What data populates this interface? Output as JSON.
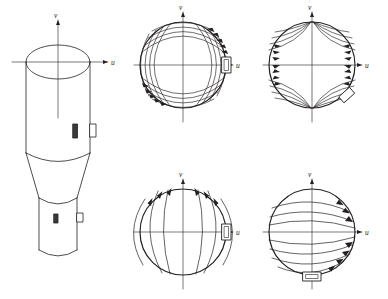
{
  "figure": {
    "kind": "technical-line-drawing",
    "background_color": "#ffffff",
    "line_color": "#231f20",
    "axis_labels": {
      "horizontal": "u",
      "vertical": "v"
    },
    "caption": ""
  },
  "body_3d": {
    "name": "stepped-cylindrical-body",
    "axis_label_v": "v",
    "axis_label_u": "u",
    "sections": [
      "upper-cylinder",
      "tapered-cone",
      "lower-cylinder"
    ],
    "markers": [
      {
        "name": "slot-marker-upper",
        "style": "filled"
      },
      {
        "name": "tab-marker-upper",
        "style": "outline"
      },
      {
        "name": "slot-marker-lower",
        "style": "filled"
      },
      {
        "name": "tab-marker-lower",
        "style": "outline"
      }
    ]
  },
  "panels": [
    {
      "id": "panel-top-left",
      "label_u": "u",
      "label_v": "v",
      "pattern": "quadrupole-saddle",
      "arrow_clusters": [
        "upper-right",
        "lower-left"
      ],
      "tab": {
        "position": "right",
        "orientation": "horizontal"
      },
      "curve_count": 4
    },
    {
      "id": "panel-top-right",
      "label_u": "u",
      "label_v": "v",
      "pattern": "hyperbolic-converging",
      "arrow_clusters": [
        "left-edge",
        "right-edge"
      ],
      "tab": {
        "position": "lower-right",
        "orientation": "angled"
      },
      "curve_count": 4
    },
    {
      "id": "panel-bottom-left",
      "label_u": "u",
      "label_v": "v",
      "pattern": "vertical-dipole",
      "arrow_clusters": [
        "upper-arc"
      ],
      "tab": {
        "position": "right",
        "orientation": "horizontal"
      },
      "curve_count": 5
    },
    {
      "id": "panel-bottom-right",
      "label_u": "u",
      "label_v": "v",
      "pattern": "horizontal-latitudinal",
      "arrow_clusters": [
        "upper-right",
        "lower-right"
      ],
      "tab": {
        "position": "bottom",
        "orientation": "vertical"
      },
      "curve_count": 8
    }
  ]
}
